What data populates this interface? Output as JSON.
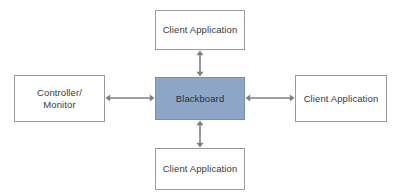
{
  "diagram": {
    "background_color": "#ffffff",
    "line_color": "#808080",
    "border_color": "#9a9a9a",
    "center_fill_color": "#8ea6c8",
    "center_border_color": "#7a8fad",
    "text_color": "#3a3a3a",
    "nodes": {
      "top": {
        "label": "Client Application"
      },
      "bottom": {
        "label": "Client Application"
      },
      "left": {
        "label": "Controller/\nMonitor"
      },
      "right": {
        "label": "Client Application"
      },
      "center": {
        "label": "Blackboard"
      }
    },
    "connectors": [
      {
        "name": "center-to-top",
        "style": "double-headed-arrow",
        "orientation": "vertical"
      },
      {
        "name": "center-to-bottom",
        "style": "double-headed-arrow",
        "orientation": "vertical"
      },
      {
        "name": "center-to-left",
        "style": "double-headed-arrow",
        "orientation": "horizontal"
      },
      {
        "name": "center-to-right",
        "style": "double-headed-arrow",
        "orientation": "horizontal"
      }
    ]
  }
}
